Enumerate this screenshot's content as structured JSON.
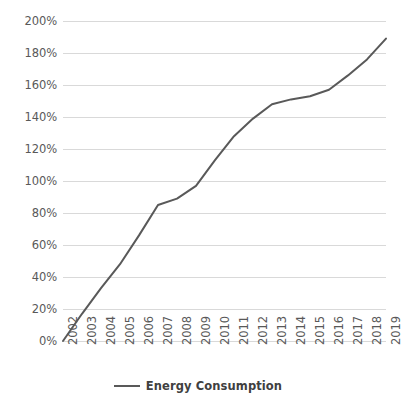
{
  "chart_data": {
    "type": "line",
    "title": "",
    "xlabel": "",
    "ylabel": "",
    "categories": [
      "2002",
      "2003",
      "2004",
      "2005",
      "2006",
      "2007",
      "2008",
      "2009",
      "2010",
      "2011",
      "2012",
      "2013",
      "2014",
      "2015",
      "2016",
      "2017",
      "2018",
      "2019"
    ],
    "series": [
      {
        "name": "Energy Consumption",
        "color": "#595959",
        "values": [
          0,
          17,
          33,
          48,
          66,
          85,
          89,
          97,
          113,
          128,
          139,
          148,
          151,
          153,
          157,
          166,
          176,
          189
        ]
      }
    ],
    "ytick_labels": [
      "200%",
      "180%",
      "160%",
      "140%",
      "120%",
      "100%",
      "80%",
      "60%",
      "40%",
      "20%",
      "0%"
    ],
    "ytick_values": [
      200,
      180,
      160,
      140,
      120,
      100,
      80,
      60,
      40,
      20,
      0
    ],
    "ylim": [
      0,
      200
    ],
    "ytick_suffix": "%",
    "grid": true,
    "grid_color": "#d9d9d9",
    "legend_position": "bottom",
    "axis_label_color": "#595959",
    "background": "#ffffff"
  },
  "legend": {
    "entries": [
      {
        "label": "Energy Consumption",
        "color": "#595959"
      }
    ]
  }
}
